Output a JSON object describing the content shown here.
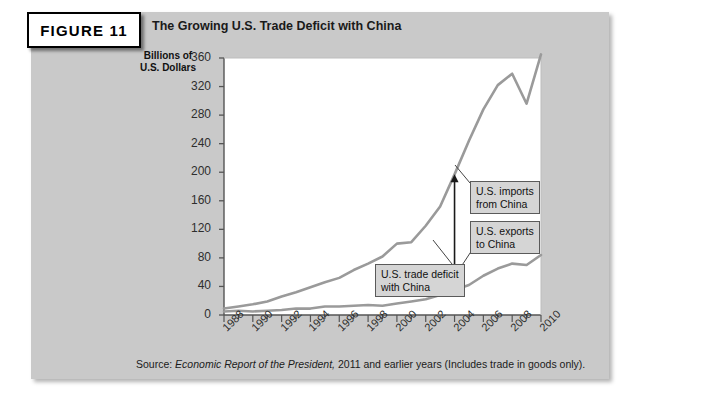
{
  "figure": {
    "tag_label": "FIGURE 11",
    "title": "The Growing U.S. Trade Deficit with China",
    "source_prefix": "Source: ",
    "source_italic": "Economic Report of the President,",
    "source_suffix": " 2011 and earlier years (Includes trade in goods only)."
  },
  "colors": {
    "panel_background": "#c9c9c9",
    "plot_background": "#ffffff",
    "line": "#9a9a9a",
    "callout_background": "#d5d5d5",
    "axis": "#555555",
    "text": "#1a1a1a"
  },
  "callouts": [
    {
      "id": "imports",
      "line1": "U.S. imports",
      "line2": "from China"
    },
    {
      "id": "exports",
      "line1": "U.S. exports",
      "line2": "to China"
    },
    {
      "id": "deficit",
      "line1": "U.S. trade deficit",
      "line2": "with China"
    }
  ],
  "chart_data": {
    "type": "line",
    "title": "The Growing U.S. Trade Deficit with China",
    "xlabel": "",
    "ylabel": "Billions of U.S. Dollars",
    "ylim": [
      0,
      360
    ],
    "ytick_labels": [
      "360",
      "320",
      "280",
      "240",
      "200",
      "160",
      "120",
      "80",
      "40",
      "0"
    ],
    "yticks": [
      360,
      320,
      280,
      240,
      200,
      160,
      120,
      80,
      40,
      0
    ],
    "xlim": [
      1988,
      2010
    ],
    "xtick_labels": [
      "1988",
      "1990",
      "1992",
      "1994",
      "1996",
      "1998",
      "2000",
      "2002",
      "2004",
      "2006",
      "2008",
      "2010"
    ],
    "xticks": [
      1988,
      1990,
      1992,
      1994,
      1996,
      1998,
      2000,
      2002,
      2004,
      2006,
      2008,
      2010
    ],
    "minor_xticks_every": 1,
    "grid": false,
    "legend_position": "inline-callouts",
    "x": [
      1988,
      1989,
      1990,
      1991,
      1992,
      1993,
      1994,
      1995,
      1996,
      1997,
      1998,
      1999,
      2000,
      2001,
      2002,
      2003,
      2004,
      2005,
      2006,
      2007,
      2008,
      2009,
      2010
    ],
    "series": [
      {
        "name": "U.S. imports from China",
        "values": [
          9,
          12,
          15,
          19,
          26,
          32,
          39,
          46,
          52,
          63,
          72,
          82,
          100,
          102,
          125,
          152,
          197,
          244,
          288,
          322,
          338,
          296,
          365
        ]
      },
      {
        "name": "U.S. exports to China",
        "values": [
          5,
          6,
          5,
          6,
          7,
          9,
          9,
          12,
          12,
          13,
          14,
          13,
          16,
          19,
          22,
          28,
          35,
          42,
          55,
          65,
          72,
          70,
          84
        ]
      }
    ],
    "annotations": [
      {
        "text": "U.S. imports from China",
        "points_to_series": "U.S. imports from China",
        "at_x": 2006
      },
      {
        "text": "U.S. exports to China",
        "points_to_series": "U.S. exports to China",
        "at_x": 2007
      },
      {
        "text": "U.S. trade deficit with China",
        "arrow": "double-headed-vertical",
        "at_x": 2004,
        "from_value": 35,
        "to_value": 197
      }
    ],
    "source": "Economic Report of the President, 2011 and earlier years (Includes trade in goods only)."
  }
}
